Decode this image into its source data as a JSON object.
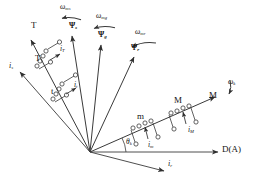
{
  "figure": {
    "type": "vector-phasor-diagram",
    "background": "#ffffff",
    "stroke_color": "#333333",
    "text_color": "#141414",
    "origin": {
      "x": 90,
      "y": 152
    },
    "reference_axis_label": "D(A)"
  },
  "labels": {
    "omega_ms": {
      "sym": "ω",
      "sub": "ms"
    },
    "omega_mg": {
      "sym": "ω",
      "sub": "mg"
    },
    "omega_mr": {
      "sym": "ω",
      "sub": "mr"
    },
    "omega_k": {
      "sym": "ω",
      "sub": "k"
    },
    "psi_s": {
      "sym": "Ψ",
      "sub": "s"
    },
    "psi_g": {
      "sym": "Ψ",
      "sub": "g"
    },
    "psi_r": {
      "sym": "Ψ",
      "sub": "r"
    },
    "i_s": {
      "sym": "i",
      "sub": "s"
    },
    "i_r": {
      "sym": "i",
      "sub": "r"
    },
    "i_T": {
      "sym": "i",
      "sub": "T"
    },
    "i_t": {
      "sym": "i",
      "sub": "t"
    },
    "i_M": {
      "sym": "i",
      "sub": "M"
    },
    "i_m": {
      "sym": "i",
      "sub": "m"
    },
    "theta_k": {
      "sym": "θ",
      "sub": "k"
    },
    "T_upper": {
      "sym": "T",
      "sub": ""
    },
    "T_lower": {
      "sym": "T",
      "sub": ""
    },
    "t_lower": {
      "sym": "t",
      "sub": ""
    },
    "M_tip": {
      "sym": "M",
      "sub": ""
    },
    "M_coil": {
      "sym": "M",
      "sub": ""
    },
    "m_coil": {
      "sym": "m",
      "sub": ""
    },
    "D_A": {
      "sym": "D(A)",
      "sub": ""
    }
  },
  "vectors": [
    {
      "name": "psi-s-vector",
      "label": "psi_s",
      "angle_deg": 104,
      "length": 118,
      "arrow": true
    },
    {
      "name": "psi-g-vector",
      "label": "psi_g",
      "angle_deg": 88,
      "length": 108,
      "arrow": true
    },
    {
      "name": "psi-r-vector",
      "label": "psi_r",
      "angle_deg": 68,
      "length": 108,
      "arrow": true
    },
    {
      "name": "i-s-vector",
      "label": "i_s",
      "angle_deg": 150,
      "length": 95,
      "arrow": true
    },
    {
      "name": "i-r-vector",
      "label": "i_r",
      "angle_deg": -20,
      "length": 82,
      "arrow": true
    },
    {
      "name": "T-axis",
      "label": "T_upper",
      "angle_deg": 122,
      "length": 128,
      "arrow": true
    },
    {
      "name": "M-axis",
      "label": "M_tip",
      "angle_deg": 22,
      "length": 140,
      "arrow": true
    },
    {
      "name": "reference-axis",
      "label": "D_A",
      "angle_deg": 0,
      "length": 140,
      "arrow": true
    }
  ],
  "arcs": [
    {
      "name": "omega-ms-arc",
      "label": "omega_ms"
    },
    {
      "name": "omega-mg-arc",
      "label": "omega_mg"
    },
    {
      "name": "omega-mr-arc",
      "label": "omega_mr"
    },
    {
      "name": "omega-k-arc",
      "label": "omega_k"
    }
  ],
  "coils": [
    {
      "name": "coil-T",
      "axis": "T-axis",
      "turns": 4,
      "current_label": "i_T"
    },
    {
      "name": "coil-t",
      "axis": "T-axis",
      "turns": 4,
      "current_label": "i_t"
    },
    {
      "name": "coil-M",
      "axis": "M-axis",
      "turns": 4,
      "current_label": "i_M"
    },
    {
      "name": "coil-m",
      "axis": "M-axis",
      "turns": 4,
      "current_label": "i_m"
    }
  ],
  "angle_marks": [
    {
      "name": "theta-k-angle",
      "label": "theta_k",
      "between": [
        "reference-axis",
        "M-axis"
      ]
    }
  ]
}
